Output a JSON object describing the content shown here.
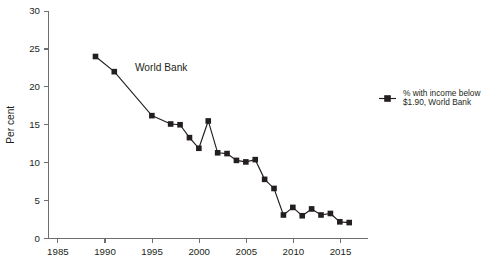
{
  "chart_data": {
    "type": "line",
    "title": "",
    "xlabel": "",
    "ylabel": "Per cent",
    "xlim": [
      1984,
      2018
    ],
    "ylim": [
      0,
      30
    ],
    "xticks": [
      1985,
      1990,
      1995,
      2000,
      2005,
      2010,
      2015
    ],
    "yticks": [
      0,
      5,
      10,
      15,
      20,
      25,
      30
    ],
    "grid": false,
    "legend_position": "right",
    "annotations": [
      {
        "text": "World Bank",
        "x": 1993.2,
        "y": 22.1
      }
    ],
    "series": [
      {
        "name": "% with income below $1.90, World Bank",
        "marker": "square",
        "color": "#231f20",
        "x": [
          1989,
          1991,
          1995,
          1997,
          1998,
          1999,
          2000,
          2001,
          2002,
          2003,
          2004,
          2005,
          2006,
          2007,
          2008,
          2009,
          2010,
          2011,
          2012,
          2013,
          2014,
          2015,
          2016
        ],
        "values": [
          24.0,
          22.0,
          16.2,
          15.1,
          15.0,
          13.3,
          11.9,
          15.5,
          11.3,
          11.2,
          10.3,
          10.1,
          10.4,
          7.8,
          6.6,
          3.1,
          4.1,
          3.0,
          3.9,
          3.1,
          3.3,
          2.2,
          2.1
        ]
      }
    ]
  },
  "legend": {
    "entries": [
      {
        "label_line1": "% with income below",
        "label_line2": "$1.90, World Bank"
      }
    ]
  },
  "axes": {
    "y_title": "Per cent",
    "y_tick_labels": [
      "0",
      "5",
      "10",
      "15",
      "20",
      "25",
      "30"
    ],
    "x_tick_labels": [
      "1985",
      "1990",
      "1995",
      "2000",
      "2005",
      "2010",
      "2015"
    ]
  }
}
